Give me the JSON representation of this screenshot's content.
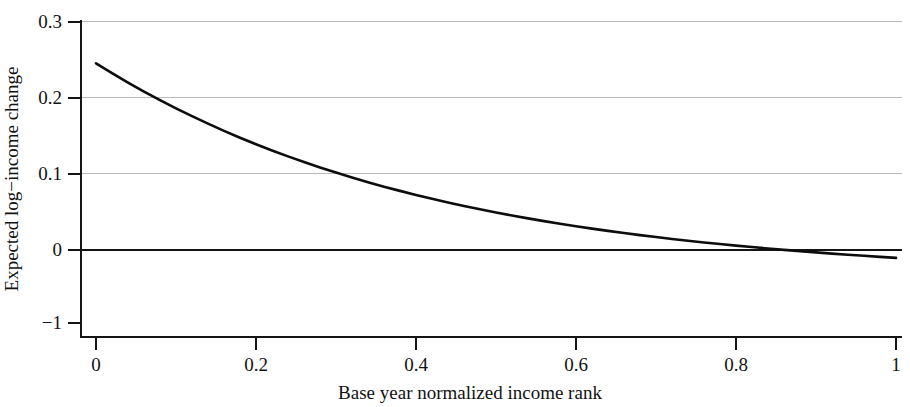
{
  "chart_data": {
    "type": "line",
    "title": "",
    "subtitle": "",
    "xlabel": "Base year normalized income rank",
    "ylabel": "Expected log−income change",
    "xlim": [
      0,
      1
    ],
    "ylim": [
      -0.09,
      0.3
    ],
    "x_ticks": [
      0,
      0.2,
      0.4,
      0.6,
      0.8,
      1
    ],
    "x_tick_labels": [
      "0",
      "0.2",
      "0.4",
      "0.6",
      "0.8",
      "1"
    ],
    "y_ticks": [
      0.3,
      0.2,
      0.1,
      0,
      -0.09
    ],
    "y_tick_labels": [
      "0.3",
      "0.2",
      "0.1",
      "0",
      "−1"
    ],
    "grid": "horizontal",
    "gridline_values": [
      0.3,
      0.2,
      0.1
    ],
    "zero_line": true,
    "legend": null,
    "legend_position": "none",
    "series": [
      {
        "name": "Expected log-income change",
        "color": "#0d0d0d",
        "x": [
          0.0,
          0.02,
          0.04,
          0.06,
          0.08,
          0.1,
          0.12,
          0.14,
          0.16,
          0.18,
          0.2,
          0.22,
          0.24,
          0.26,
          0.28,
          0.3,
          0.32,
          0.34,
          0.36,
          0.38,
          0.4,
          0.42,
          0.44,
          0.46,
          0.48,
          0.5,
          0.52,
          0.54,
          0.56,
          0.58,
          0.6,
          0.62,
          0.64,
          0.66,
          0.68,
          0.7,
          0.72,
          0.74,
          0.76,
          0.78,
          0.8,
          0.82,
          0.84,
          0.86,
          0.88,
          0.9,
          0.92,
          0.94,
          0.96,
          0.98,
          1.0
        ],
        "y": [
          0.246,
          0.233,
          0.2205,
          0.2086,
          0.1972,
          0.1863,
          0.1759,
          0.166,
          0.1565,
          0.1474,
          0.1388,
          0.1305,
          0.1227,
          0.1152,
          0.108,
          0.1012,
          0.0947,
          0.0885,
          0.0826,
          0.077,
          0.0716,
          0.0665,
          0.0617,
          0.057,
          0.0526,
          0.0484,
          0.0444,
          0.0406,
          0.0369,
          0.0335,
          0.0302,
          0.027,
          0.024,
          0.0211,
          0.0184,
          0.0158,
          0.0133,
          0.011,
          0.0087,
          0.0066,
          0.0045,
          0.0026,
          0.0007,
          -0.0011,
          -0.0028,
          -0.0045,
          -0.0061,
          -0.0076,
          -0.009,
          -0.0104,
          -0.0118
        ],
        "zero_crossing_x": 0.845,
        "y_at_x0": 0.246,
        "y_at_x1": -0.0118
      }
    ]
  },
  "geometry": {
    "plot_left_px": 80,
    "plot_right_px": 902,
    "x0_px": 96,
    "x1_px": 896,
    "y_top_px": 21,
    "y_baseline_px": 337,
    "y_zero_px": 249,
    "y_unit_px_per_0_1": 75.5
  },
  "axes": {
    "y_axis_name": "y-axis",
    "x_axis_name": "x-axis"
  }
}
